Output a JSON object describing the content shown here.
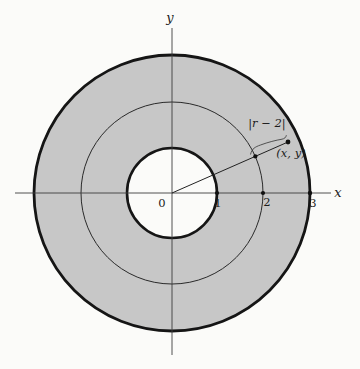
{
  "figure": {
    "axis_labels": {
      "x": "x",
      "y": "y"
    },
    "ticks": [
      "0",
      "1",
      "2",
      "3"
    ],
    "distance_label": "|r − 2|",
    "point_label": "(x, y)",
    "circle_radii_units": [
      1,
      2,
      3
    ],
    "colors": {
      "annulus_fill": "#c7c7c7",
      "inner_fill": "#fbfbf9",
      "circle_stroke": "#151515",
      "axis_stroke": "#3d3d3d",
      "text": "#1c1c1c",
      "background": "#fbfbf9"
    }
  }
}
